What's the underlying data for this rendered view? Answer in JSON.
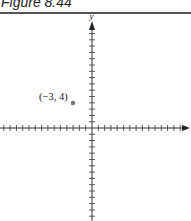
{
  "figure": {
    "title": "Figure 8.44"
  },
  "chart_data": {
    "type": "scatter",
    "title": "Figure 8.44",
    "xlabel": "",
    "ylabel": "y",
    "points": [
      {
        "x": -3,
        "y": 4,
        "label": "(−3, 4)"
      }
    ],
    "xlim": [
      -14,
      15
    ],
    "ylim": [
      -15,
      16
    ],
    "grid": false,
    "tick_spacing": 1,
    "axis_arrows": {
      "x_positive": true,
      "y_positive": true
    },
    "colors": {
      "axis": "#333333",
      "point": "#777777"
    }
  },
  "labels": {
    "y_axis": "y",
    "point": "(−3, 4)"
  }
}
